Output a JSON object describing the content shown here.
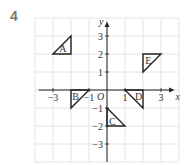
{
  "question_number": "4",
  "grid": {
    "origin_px": [
      107,
      90
    ],
    "unit_px": 18,
    "x_range": [
      -4,
      4
    ],
    "y_range": [
      -4,
      4
    ],
    "grid_color": "#dddddd",
    "axis_color": "#222222"
  },
  "axes": {
    "x_label": "x",
    "y_label": "y",
    "origin_label": "O",
    "x_ticks": [
      {
        "value": -3,
        "label": "−3"
      },
      {
        "value": -1,
        "label": "−1"
      },
      {
        "value": 1,
        "label": "1"
      },
      {
        "value": 3,
        "label": "3"
      }
    ],
    "y_ticks": [
      {
        "value": 3,
        "label": "3"
      },
      {
        "value": 2,
        "label": "2"
      },
      {
        "value": 1,
        "label": "1"
      },
      {
        "value": -1,
        "label": "−1"
      },
      {
        "value": -2,
        "label": "−2"
      },
      {
        "value": -3,
        "label": "−3"
      }
    ]
  },
  "triangles": [
    {
      "label": "A",
      "points": [
        [
          -3,
          2
        ],
        [
          -2,
          3
        ],
        [
          -2,
          2
        ]
      ],
      "label_at": [
        -2.45,
        2.3
      ]
    },
    {
      "label": "B",
      "points": [
        [
          -2,
          0
        ],
        [
          -1,
          0
        ],
        [
          -2,
          -1
        ]
      ],
      "label_at": [
        -1.75,
        -0.35
      ]
    },
    {
      "label": "C",
      "points": [
        [
          0,
          -1
        ],
        [
          0,
          -2
        ],
        [
          1,
          -2
        ]
      ],
      "label_at": [
        0.3,
        -1.75
      ]
    },
    {
      "label": "D",
      "points": [
        [
          1,
          0
        ],
        [
          2,
          0
        ],
        [
          2,
          -1
        ]
      ],
      "label_at": [
        1.75,
        -0.35
      ]
    },
    {
      "label": "E",
      "points": [
        [
          2,
          2
        ],
        [
          3,
          2
        ],
        [
          2,
          1
        ]
      ],
      "label_at": [
        2.3,
        1.65
      ]
    }
  ]
}
